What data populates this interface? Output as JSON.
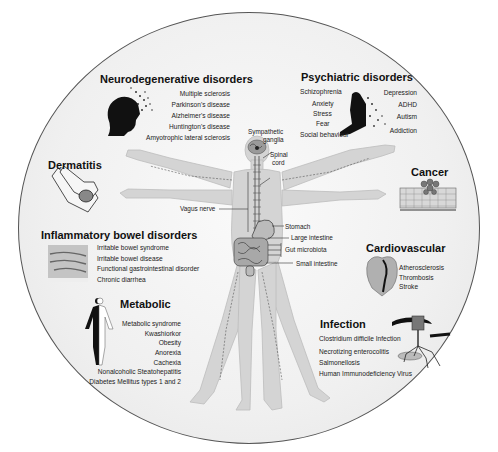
{
  "diagram": {
    "type": "gut-brain axis disease map",
    "anatomy_labels": {
      "sympathetic_ganglia": "Sympathetic ganglia",
      "sympathetic_1": "Sympathetic",
      "sympathetic_2": "ganglia",
      "spinal_cord_1": "Spinal",
      "spinal_cord_2": "cord",
      "vagus_nerve": "Vagus nerve",
      "stomach": "Stomach",
      "large_intestine": "Large intestine",
      "gut_microbiota": "Gut microbiota",
      "small_intestine": "Small intestine"
    },
    "categories": [
      {
        "id": "neurodegenerative",
        "title": "Neurodegenerative disorders",
        "icon": "head-dissolving-icon",
        "items": [
          "Multiple sclerosis",
          "Parkinson's disease",
          "Alzheimer's disease",
          "Huntington's disease",
          "Amyotrophic lateral sclerosis"
        ]
      },
      {
        "id": "psychiatric",
        "title": "Psychiatric disorders",
        "icon": "sitting-figure-dissolving-icon",
        "items_left": [
          "Schizophrenia",
          "Anxiety",
          "Stress",
          "Fear",
          "Social behaviour"
        ],
        "items_right": [
          "Depression",
          "ADHD",
          "Autism",
          "Addiction"
        ]
      },
      {
        "id": "dermatitis",
        "title": "Dermatitis",
        "icon": "hand-rash-icon",
        "items": []
      },
      {
        "id": "cancer",
        "title": "Cancer",
        "icon": "tumor-tissue-icon",
        "items": []
      },
      {
        "id": "ibd",
        "title": "Inflammatory bowel disorders",
        "icon": "abdomen-pain-icon",
        "items": [
          "Irritable bowel syndrome",
          "Irritable bowel disease",
          "Functional gastrointestinal disorder",
          "Chronic diarrhea"
        ]
      },
      {
        "id": "cardiovascular",
        "title": "Cardiovascular",
        "icon": "heart-icon",
        "items": [
          "Atherosclerosis",
          "Thrombosis",
          "Stroke"
        ]
      },
      {
        "id": "metabolic",
        "title": "Metabolic",
        "icon": "body-silhouette-icon",
        "items": [
          "Metabolic syndrome",
          "Kwashiorkor",
          "Obesity",
          "Anorexia",
          "Cachexia",
          "Nonalcoholic Steatohepatitis",
          "Diabetes Mellitus types 1 and 2"
        ]
      },
      {
        "id": "infection",
        "title": "Infection",
        "icon": "bacteriophage-icon",
        "items": [
          "Clostridium difficile Infection",
          "Necrotizing enterocolitis",
          "Salmonellosis",
          "Human Immunodeficiency Virus"
        ]
      }
    ],
    "colors": {
      "background": "#ffffff",
      "oval_fill": "#f0f0f0",
      "oval_border": "#555555",
      "body_fill": "#d6d6d6",
      "text": "#1a1a1a"
    }
  }
}
